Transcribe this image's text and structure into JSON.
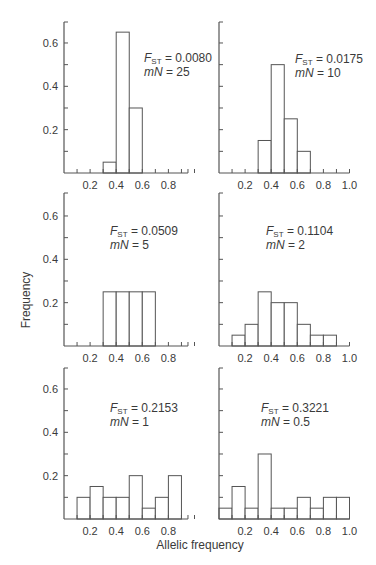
{
  "figure": {
    "ylabel": "Frequency",
    "xlabel": "Allelic frequency",
    "colors": {
      "stroke": "#555555",
      "text": "#3a3a3a",
      "fill": "#ffffff"
    }
  },
  "chart_data": [
    {
      "type": "bar",
      "panel": "top-left",
      "annotation": {
        "fst": "F_ST = 0.0080",
        "fst_value": "0.0080",
        "mn": "mN = 25",
        "mn_value": "25"
      },
      "bin_edges": [
        0.0,
        0.1,
        0.2,
        0.3,
        0.4,
        0.5,
        0.6,
        0.7,
        0.8,
        0.9
      ],
      "bins": [
        {
          "x0": 0.3,
          "x1": 0.4,
          "y": 0.05
        },
        {
          "x0": 0.4,
          "x1": 0.5,
          "y": 0.65
        },
        {
          "x0": 0.5,
          "x1": 0.6,
          "y": 0.3
        }
      ],
      "xticks": [
        "0.2",
        "0.4",
        "0.6",
        "0.8"
      ],
      "yticks": [
        "0.2",
        "0.4",
        "0.6"
      ],
      "xlim": [
        0,
        0.95
      ],
      "ylim": [
        0,
        0.7
      ],
      "grid": false
    },
    {
      "type": "bar",
      "panel": "top-right",
      "annotation": {
        "fst": "F_ST = 0.0175",
        "fst_value": "0.0175",
        "mn": "mN = 10",
        "mn_value": "10"
      },
      "bins": [
        {
          "x0": 0.3,
          "x1": 0.4,
          "y": 0.15
        },
        {
          "x0": 0.4,
          "x1": 0.5,
          "y": 0.5
        },
        {
          "x0": 0.5,
          "x1": 0.6,
          "y": 0.25
        },
        {
          "x0": 0.6,
          "x1": 0.7,
          "y": 0.1
        }
      ],
      "xticks": [
        "0.2",
        "0.4",
        "0.6",
        "0.8",
        "1.0"
      ],
      "yticks": [],
      "xlim": [
        0,
        1.0
      ],
      "ylim": [
        0,
        0.7
      ],
      "grid": false
    },
    {
      "type": "bar",
      "panel": "middle-left",
      "annotation": {
        "fst": "F_ST = 0.0509",
        "fst_value": "0.0509",
        "mn": "mN = 5",
        "mn_value": "5"
      },
      "bins": [
        {
          "x0": 0.3,
          "x1": 0.4,
          "y": 0.25
        },
        {
          "x0": 0.4,
          "x1": 0.5,
          "y": 0.25
        },
        {
          "x0": 0.5,
          "x1": 0.6,
          "y": 0.25
        },
        {
          "x0": 0.6,
          "x1": 0.7,
          "y": 0.25
        }
      ],
      "xticks": [
        "0.2",
        "0.4",
        "0.6",
        "0.8"
      ],
      "yticks": [
        "0.2",
        "0.4",
        "0.6"
      ],
      "xlim": [
        0,
        0.95
      ],
      "ylim": [
        0,
        0.7
      ],
      "grid": false
    },
    {
      "type": "bar",
      "panel": "middle-right",
      "annotation": {
        "fst": "F_ST = 0.1104",
        "fst_value": "0.1104",
        "mn": "mN = 2",
        "mn_value": "2"
      },
      "bins": [
        {
          "x0": 0.1,
          "x1": 0.2,
          "y": 0.05
        },
        {
          "x0": 0.2,
          "x1": 0.3,
          "y": 0.1
        },
        {
          "x0": 0.3,
          "x1": 0.4,
          "y": 0.25
        },
        {
          "x0": 0.4,
          "x1": 0.5,
          "y": 0.2
        },
        {
          "x0": 0.5,
          "x1": 0.6,
          "y": 0.2
        },
        {
          "x0": 0.6,
          "x1": 0.7,
          "y": 0.1
        },
        {
          "x0": 0.7,
          "x1": 0.8,
          "y": 0.05
        },
        {
          "x0": 0.8,
          "x1": 0.9,
          "y": 0.05
        }
      ],
      "xticks": [
        "0.2",
        "0.4",
        "0.6",
        "0.8",
        "1.0"
      ],
      "yticks": [],
      "xlim": [
        0,
        1.0
      ],
      "ylim": [
        0,
        0.7
      ],
      "grid": false
    },
    {
      "type": "bar",
      "panel": "bottom-left",
      "annotation": {
        "fst": "F_ST = 0.2153",
        "fst_value": "0.2153",
        "mn": "mN = 1",
        "mn_value": "1"
      },
      "bins": [
        {
          "x0": 0.1,
          "x1": 0.2,
          "y": 0.1
        },
        {
          "x0": 0.2,
          "x1": 0.3,
          "y": 0.15
        },
        {
          "x0": 0.3,
          "x1": 0.4,
          "y": 0.1
        },
        {
          "x0": 0.4,
          "x1": 0.5,
          "y": 0.1
        },
        {
          "x0": 0.5,
          "x1": 0.6,
          "y": 0.2
        },
        {
          "x0": 0.6,
          "x1": 0.7,
          "y": 0.05
        },
        {
          "x0": 0.7,
          "x1": 0.8,
          "y": 0.1
        },
        {
          "x0": 0.8,
          "x1": 0.9,
          "y": 0.2
        }
      ],
      "xticks": [
        "0.2",
        "0.4",
        "0.6",
        "0.8"
      ],
      "yticks": [
        "0.2",
        "0.4",
        "0.6"
      ],
      "xlim": [
        0,
        0.95
      ],
      "ylim": [
        0,
        0.7
      ],
      "grid": false
    },
    {
      "type": "bar",
      "panel": "bottom-right",
      "annotation": {
        "fst": "F_ST = 0.3221",
        "fst_value": "0.3221",
        "mn": "mN = 0.5",
        "mn_value": "0.5"
      },
      "bins": [
        {
          "x0": 0.0,
          "x1": 0.1,
          "y": 0.05
        },
        {
          "x0": 0.1,
          "x1": 0.2,
          "y": 0.15
        },
        {
          "x0": 0.2,
          "x1": 0.3,
          "y": 0.05
        },
        {
          "x0": 0.3,
          "x1": 0.4,
          "y": 0.3
        },
        {
          "x0": 0.4,
          "x1": 0.5,
          "y": 0.05
        },
        {
          "x0": 0.5,
          "x1": 0.6,
          "y": 0.05
        },
        {
          "x0": 0.6,
          "x1": 0.7,
          "y": 0.1
        },
        {
          "x0": 0.7,
          "x1": 0.8,
          "y": 0.05
        },
        {
          "x0": 0.8,
          "x1": 0.9,
          "y": 0.1
        },
        {
          "x0": 0.9,
          "x1": 1.0,
          "y": 0.1
        }
      ],
      "xticks": [
        "0.2",
        "0.4",
        "0.6",
        "0.8",
        "1.0"
      ],
      "yticks": [],
      "xlim": [
        0,
        1.0
      ],
      "ylim": [
        0,
        0.7
      ],
      "grid": false
    }
  ]
}
